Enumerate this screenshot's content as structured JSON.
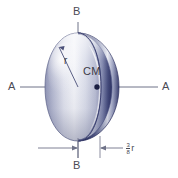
{
  "figure": {
    "background_color": "#ffffff",
    "body_colors": {
      "shell_dark": "#2b2f63",
      "shell_mid": "#6a72a0",
      "shell_light": "#d8dae8",
      "shell_highlight": "#ffffff",
      "outline": "#3a3f70",
      "axis_line": "#6f7288",
      "text": "#4a4a55"
    }
  },
  "labels": {
    "axis_b_top": "B",
    "axis_b_bottom": "B",
    "axis_a_left": "A",
    "axis_a_right": "A",
    "center_of_mass": "CM",
    "radius": "r",
    "dimension_numerator": "3",
    "dimension_denominator": "8",
    "dimension_unit": "r"
  },
  "geometry": {
    "center_x": 78,
    "center_y": 87,
    "cm_dot_x": 97,
    "cm_dot_y": 87,
    "sphere_radius_x": 33,
    "sphere_radius_y": 54,
    "b_axis_top_y": 22,
    "b_axis_bottom_y": 158,
    "a_axis_left_x": 20,
    "a_axis_right_x": 158,
    "dimension_line_y": 148,
    "dimension_from_x": 78,
    "dimension_to_x": 100
  }
}
